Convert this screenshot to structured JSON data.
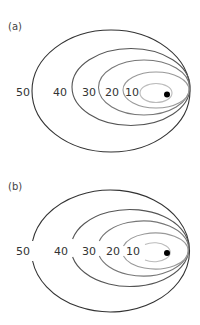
{
  "panels": [
    {
      "id": "a",
      "label": "(a)",
      "style": "closed contours",
      "contours": [
        {
          "value": "50",
          "color": "#333333"
        },
        {
          "value": "40",
          "color": "#555555"
        },
        {
          "value": "30",
          "color": "#777777"
        },
        {
          "value": "20",
          "color": "#999999"
        },
        {
          "value": "10",
          "color": "#bbbbbb"
        }
      ],
      "marker": "filled black dot near right focus"
    },
    {
      "id": "b",
      "label": "(b)",
      "style": "contours with gaps at labels",
      "contours": [
        {
          "value": "50",
          "color": "#333333"
        },
        {
          "value": "40",
          "color": "#555555"
        },
        {
          "value": "30",
          "color": "#777777"
        },
        {
          "value": "20",
          "color": "#999999"
        },
        {
          "value": "10",
          "color": "#bbbbbb"
        }
      ],
      "marker": "filled black dot near right focus"
    }
  ]
}
